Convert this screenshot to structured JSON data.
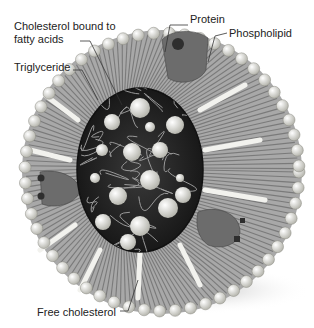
{
  "diagram": {
    "colors": {
      "background": "#ffffff",
      "core": "#2a2a2a",
      "core_strands": "#9a9a9a",
      "shell_stripes": "#8a8a8a",
      "phospholipid_heads": "#dcdcd4",
      "protein": "#6a6a6a",
      "protein_dots": "#2e2e2e",
      "text": "#222222"
    },
    "labels": {
      "cholesterol_bound": "Cholesterol bound to fatty acids",
      "triglyceride": "Triglyceride",
      "protein": "Protein",
      "phospholipid": "Phospholipid",
      "free_cholesterol": "Free cholesterol"
    }
  }
}
